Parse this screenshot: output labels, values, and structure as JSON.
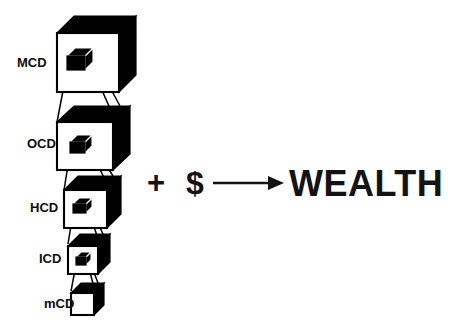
{
  "figure": {
    "background_color": "#ffffff",
    "ink_color": "#000000"
  },
  "cube_stack": {
    "name": "nested-cube-stack",
    "description": "Five cubes of decreasing size stacked top to bottom, each containing a small solid black inner cube whose projection lines expand into the cube below",
    "levels": [
      {
        "label": "MCD",
        "order": 1,
        "relative_size": "largest",
        "has_inner_cube": true,
        "front_face_color": "#ffffff",
        "top_face_color": "#000000",
        "side_face_color": "#000000"
      },
      {
        "label": "OCD",
        "order": 2,
        "relative_size": "large",
        "has_inner_cube": true,
        "front_face_color": "#ffffff",
        "top_face_color": "#000000",
        "side_face_color": "#000000"
      },
      {
        "label": "HCD",
        "order": 3,
        "relative_size": "medium",
        "has_inner_cube": true,
        "front_face_color": "#ffffff",
        "top_face_color": "#000000",
        "side_face_color": "#000000"
      },
      {
        "label": "ICD",
        "order": 4,
        "relative_size": "small",
        "has_inner_cube": true,
        "front_face_color": "#ffffff",
        "top_face_color": "#000000",
        "side_face_color": "#000000"
      },
      {
        "label": "mCD",
        "order": 5,
        "relative_size": "smallest",
        "has_inner_cube": false,
        "front_face_color": "#ffffff",
        "top_face_color": "#000000",
        "side_face_color": "#000000"
      }
    ]
  },
  "equation": {
    "name": "wealth-equation",
    "plus_sign": "+",
    "dollar_sign": "$",
    "arrow": "arrow-right-icon",
    "result": "WEALTH"
  }
}
